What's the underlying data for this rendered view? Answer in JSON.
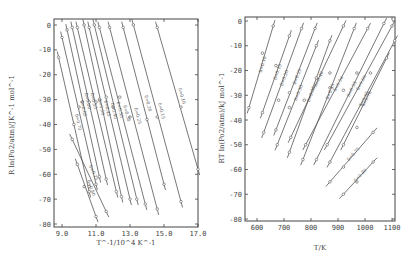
{
  "chart_data": [
    {
      "type": "line",
      "title": "",
      "xlabel": "T^-1/10^4 K^-1",
      "ylabel": "R ln(Po2/atm)/JK^-1 mol^-1",
      "xlim": [
        8.7,
        17.0
      ],
      "ylim": [
        -80,
        0
      ],
      "xticks": [
        9.0,
        11.0,
        13.0,
        15.0,
        17.0
      ],
      "yticks": [
        0,
        -10,
        -20,
        -30,
        -40,
        -50,
        -60,
        -70,
        -80
      ],
      "grid": false,
      "series": [
        {
          "name": "δ=0.10",
          "x": [
            14.6,
            16.0,
            17.0
          ],
          "y": [
            -1,
            -33,
            -58
          ]
        },
        {
          "name": "δ=0.15",
          "x": [
            13.2,
            14.6,
            16.0
          ],
          "y": [
            0,
            -37,
            -71
          ]
        },
        {
          "name": "δ=0.20",
          "x": [
            12.6,
            14.0,
            15.0
          ],
          "y": [
            -1,
            -38,
            -64
          ]
        },
        {
          "name": "δ=0.25",
          "x": [
            11.8,
            13.0,
            14.6
          ],
          "y": [
            -1,
            -37,
            -74
          ]
        },
        {
          "name": "δ=0.30",
          "x": [
            11.2,
            12.4,
            13.9
          ],
          "y": [
            -1,
            -29,
            -72
          ]
        },
        {
          "name": "δ=0.35",
          "x": [
            10.9,
            12.0,
            13.4
          ],
          "y": [
            0,
            -33,
            -70
          ]
        },
        {
          "name": "δ=0.40",
          "x": [
            10.6,
            11.6,
            13.0
          ],
          "y": [
            -1,
            -29,
            -70
          ]
        },
        {
          "name": "δ=0.45",
          "x": [
            10.3,
            11.2,
            12.5
          ],
          "y": [
            0,
            -30,
            -69
          ]
        },
        {
          "name": "δ=0.50",
          "x": [
            9.9,
            11.0,
            12.2
          ],
          "y": [
            -1,
            -31,
            -67
          ]
        },
        {
          "name": "δ=0.55",
          "x": [
            9.6,
            10.6,
            11.6
          ],
          "y": [
            -1,
            -31,
            -62
          ]
        },
        {
          "name": "δ=0.60",
          "x": [
            9.3,
            10.2,
            11.2
          ],
          "y": [
            -2,
            -31,
            -61
          ]
        },
        {
          "name": "δ=0.65",
          "x": [
            9.0,
            10.0,
            11.0
          ],
          "y": [
            -5,
            -33,
            -64
          ]
        },
        {
          "name": "δ=0.70",
          "x": [
            8.8,
            9.7,
            10.6
          ],
          "y": [
            -13,
            -40,
            -67
          ]
        },
        {
          "name": "δ=0.75",
          "x": [
            9.6,
            10.3,
            11.6
          ],
          "y": [
            -46,
            -65,
            -75
          ]
        },
        {
          "name": "δ=0.80",
          "x": [
            9.9,
            10.6,
            11.0
          ],
          "y": [
            -56,
            -65,
            -77
          ]
        }
      ],
      "legend": "inline labels along lines"
    },
    {
      "type": "line",
      "title": "",
      "xlabel": "T/K",
      "ylabel": "RT ln(Po2/atm)/kJ mol^-1",
      "xlim": [
        550,
        1120
      ],
      "ylim": [
        -80,
        0
      ],
      "xticks": [
        600,
        700,
        800,
        900,
        1000,
        1100
      ],
      "yticks": [
        0,
        -10,
        -20,
        -30,
        -40,
        -50,
        -60,
        -70,
        -80
      ],
      "grid": false,
      "series": [
        {
          "name": "δ=0.10",
          "x": [
            570,
            620,
            660
          ],
          "y": [
            -35,
            -13,
            -2
          ]
        },
        {
          "name": "δ=0.15",
          "x": [
            620,
            670,
            720
          ],
          "y": [
            -37,
            -18,
            -6
          ]
        },
        {
          "name": "δ=0.20",
          "x": [
            625,
            680,
            765
          ],
          "y": [
            -45,
            -32,
            -3
          ]
        },
        {
          "name": "δ=0.25",
          "x": [
            670,
            720,
            815
          ],
          "y": [
            -44,
            -29,
            -3
          ]
        },
        {
          "name": "δ=0.30",
          "x": [
            675,
            720,
            820
          ],
          "y": [
            -50,
            -35,
            -10
          ]
        },
        {
          "name": "δ=0.35",
          "x": [
            720,
            775,
            870
          ],
          "y": [
            -53,
            -32,
            -8
          ]
        },
        {
          "name": "δ=0.40",
          "x": [
            725,
            820,
            920
          ],
          "y": [
            -47,
            -23,
            -2
          ]
        },
        {
          "name": "δ=0.45",
          "x": [
            770,
            870,
            960
          ],
          "y": [
            -56,
            -27,
            -3
          ]
        },
        {
          "name": "δ=0.50",
          "x": [
            780,
            870,
            1010
          ],
          "y": [
            -50,
            -21,
            -3
          ]
        },
        {
          "name": "δ=0.55",
          "x": [
            820,
            920,
            1070
          ],
          "y": [
            -56,
            -28,
            -1
          ]
        },
        {
          "name": "δ=0.60",
          "x": [
            860,
            970,
            1100
          ],
          "y": [
            -50,
            -21,
            -2
          ]
        },
        {
          "name": "δ=0.65",
          "x": [
            870,
            1020,
            1110
          ],
          "y": [
            -57,
            -21,
            -8
          ]
        },
        {
          "name": "δ=0.70",
          "x": [
            920,
            970,
            1080
          ],
          "y": [
            -50,
            -43,
            -15
          ]
        },
        {
          "name": "δ=0.75",
          "x": [
            870,
            920,
            1030
          ],
          "y": [
            -65,
            -59,
            -45
          ]
        },
        {
          "name": "δ=0.80",
          "x": [
            920,
            970,
            1030
          ],
          "y": [
            -70,
            -65,
            -57
          ]
        }
      ],
      "legend": "inline labels along lines"
    }
  ]
}
